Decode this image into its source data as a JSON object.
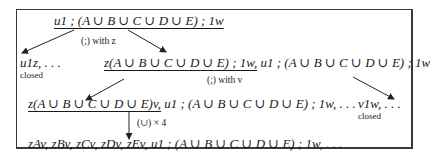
{
  "diagram": {
    "root": "u1 ; (A ∪ B ∪ C ∪ D ∪ E) ; 1w",
    "root_underlined": "u1 ; (A ∪ B ∪ C ∪ D ∪ E) ; 1w",
    "edge1_label": "(;) with z",
    "left_branch": {
      "text": "u1z, . . .",
      "status": "closed"
    },
    "mid_branch": {
      "underlined": "z(A ∪ B ∪ C ∪ D ∪ E) ; 1w,",
      "rest": " u1 ; (A ∪ B ∪ C ∪ D ∪ E) ; 1w"
    },
    "edge2_label": "(;) with v",
    "right_branch": {
      "text": "v1w, . . .",
      "status": "closed"
    },
    "level3": {
      "underlined": "z(A ∪ B ∪ C ∪ D ∪ E)v,",
      "rest": " u1 ; (A ∪ B ∪ C ∪ D ∪ E) ; 1w, . . ."
    },
    "edge3_label": "(∪) × 4",
    "level4": "zAv, zBv, zCv, zDv, zEv, u1 ; (A ∪ B ∪ C ∪ D ∪ E) ; 1w, . . ."
  }
}
